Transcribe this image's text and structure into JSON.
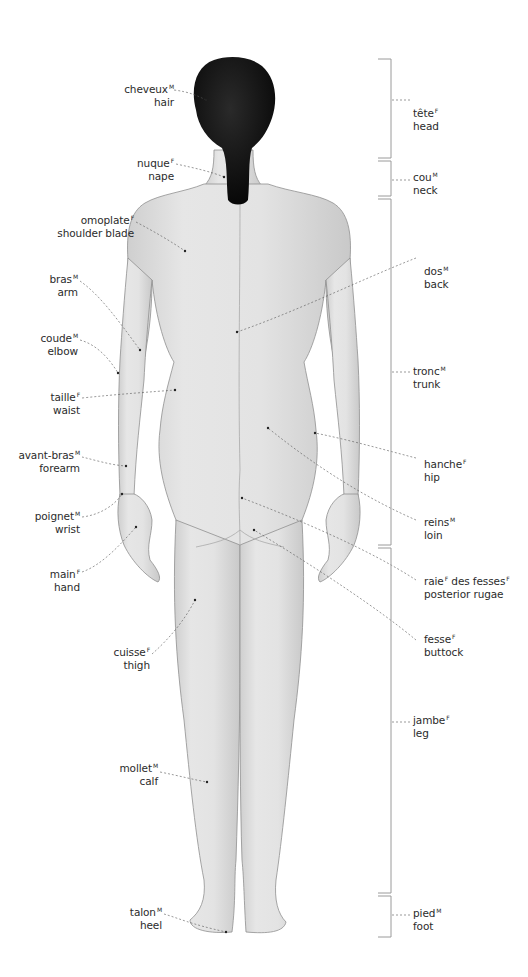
{
  "diagram": {
    "colors": {
      "skin": "#e2e2e2",
      "skin_shadow": "#b9b9b9",
      "outline": "#8a8a8a",
      "hair": "#111111",
      "leader": "#555555",
      "bracket": "#9a9a9a",
      "text": "#2b2b2b"
    },
    "left_labels": [
      {
        "id": "hair",
        "fr": "cheveux",
        "gender": "M",
        "en": "hair"
      },
      {
        "id": "nape",
        "fr": "nuque",
        "gender": "F",
        "en": "nape"
      },
      {
        "id": "shoulder-blade",
        "fr": "omoplate",
        "gender": "F",
        "en": "shoulder blade"
      },
      {
        "id": "arm",
        "fr": "bras",
        "gender": "M",
        "en": "arm"
      },
      {
        "id": "elbow",
        "fr": "coude",
        "gender": "M",
        "en": "elbow"
      },
      {
        "id": "waist",
        "fr": "taille",
        "gender": "F",
        "en": "waist"
      },
      {
        "id": "forearm",
        "fr": "avant-bras",
        "gender": "M",
        "en": "forearm"
      },
      {
        "id": "wrist",
        "fr": "poignet",
        "gender": "M",
        "en": "wrist"
      },
      {
        "id": "hand",
        "fr": "main",
        "gender": "F",
        "en": "hand"
      },
      {
        "id": "thigh",
        "fr": "cuisse",
        "gender": "F",
        "en": "thigh"
      },
      {
        "id": "calf",
        "fr": "mollet",
        "gender": "M",
        "en": "calf"
      },
      {
        "id": "heel",
        "fr": "talon",
        "gender": "M",
        "en": "heel"
      }
    ],
    "right_labels": [
      {
        "id": "back",
        "fr": "dos",
        "gender": "M",
        "en": "back"
      },
      {
        "id": "hip",
        "fr": "hanche",
        "gender": "F",
        "en": "hip"
      },
      {
        "id": "loin",
        "fr": "reins",
        "gender": "M",
        "en": "loin"
      },
      {
        "id": "posterior-rugae",
        "fr": "raie",
        "gender": "F",
        "fr2": " des fesses",
        "gender2": "F",
        "en": "posterior rugae"
      },
      {
        "id": "buttock",
        "fr": "fesse",
        "gender": "F",
        "en": "buttock"
      }
    ],
    "region_labels": [
      {
        "id": "head",
        "fr": "tête",
        "gender": "F",
        "en": "head"
      },
      {
        "id": "neck",
        "fr": "cou",
        "gender": "M",
        "en": "neck"
      },
      {
        "id": "trunk",
        "fr": "tronc",
        "gender": "M",
        "en": "trunk"
      },
      {
        "id": "leg",
        "fr": "jambe",
        "gender": "F",
        "en": "leg"
      },
      {
        "id": "foot",
        "fr": "pied",
        "gender": "M",
        "en": "foot"
      }
    ]
  }
}
